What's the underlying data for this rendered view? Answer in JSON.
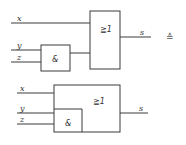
{
  "diagram": {
    "top": {
      "inputs": [
        "x",
        "y",
        "z"
      ],
      "and_gate_label": "&",
      "or_gate_label": "≧1",
      "output": "s"
    },
    "equivalence_symbol": "≙",
    "bottom": {
      "inputs": [
        "x",
        "y",
        "z"
      ],
      "and_gate_label": "&",
      "or_gate_label": "≧1",
      "output": "s"
    }
  }
}
